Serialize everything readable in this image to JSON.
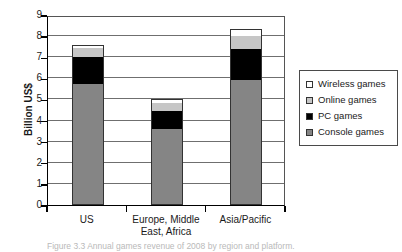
{
  "figure": {
    "caption": "Figure 3.3  Annual games revenue of 2008 by region and platform."
  },
  "chart_data": {
    "type": "bar",
    "stacked": true,
    "title": "",
    "xlabel": "",
    "ylabel": "Billion US$",
    "ylim": [
      0,
      9
    ],
    "ytick_labels": [
      "0",
      "1",
      "2",
      "3",
      "4",
      "5",
      "6",
      "7",
      "8",
      "9"
    ],
    "yticks": [
      0,
      1,
      2,
      3,
      4,
      5,
      6,
      7,
      8,
      9
    ],
    "grid": "horizontal",
    "legend_position": "right",
    "categories": [
      "US",
      "Europe, Middle East, Africa",
      "Asia/Pacific"
    ],
    "category_lines": [
      [
        "US"
      ],
      [
        "Europe, Middle",
        "East, Africa"
      ],
      [
        "Asia/Pacific"
      ]
    ],
    "series": [
      {
        "name": "Console games",
        "color": "#858585",
        "values": [
          5.75,
          3.6,
          5.9
        ]
      },
      {
        "name": "PC games",
        "color": "#000000",
        "values": [
          1.25,
          0.85,
          1.5
        ]
      },
      {
        "name": "Online games",
        "color": "#c6c6c6",
        "values": [
          0.45,
          0.4,
          0.6
        ]
      },
      {
        "name": "Wireless games",
        "color": "#ffffff",
        "values": [
          0.15,
          0.15,
          0.35
        ]
      }
    ],
    "totals": [
      7.6,
      5.0,
      8.35
    ],
    "legend_order": [
      "Wireless games",
      "Online games",
      "PC games",
      "Console games"
    ]
  }
}
